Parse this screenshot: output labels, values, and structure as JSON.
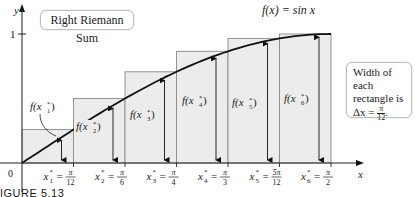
{
  "chart_data": {
    "type": "bar",
    "title": "Right Riemann Sum",
    "function_label": "f(x) = sin x",
    "xlabel": "x",
    "ylabel": "y",
    "x_range": [
      0,
      1.5708
    ],
    "ylim": [
      0,
      1
    ],
    "y_ticks": [
      "0",
      "1"
    ],
    "categories": [
      "x1* = π/12",
      "x2* = π/6",
      "x3* = π/4",
      "x4* = π/3",
      "x5* = 5π/12",
      "x6* = π/2"
    ],
    "sample_points": [
      0.2618,
      0.5236,
      0.7854,
      1.0472,
      1.309,
      1.5708
    ],
    "values": [
      0.259,
      0.5,
      0.707,
      0.866,
      0.966,
      1.0
    ],
    "value_labels": [
      "f(x1*)",
      "f(x2*)",
      "f(x3*)",
      "f(x4*)",
      "f(x5*)",
      "f(x6*)"
    ],
    "rectangle_width": "π/12",
    "annotation": "Width of each rectangle is Δx = π/12.",
    "grid": false,
    "colors": {
      "rect_fill": "#ececec",
      "rect_stroke": "#8a8a8a",
      "curve": "#111111",
      "axis": "#222222"
    }
  },
  "title_box": {
    "text": "Right Riemann Sum"
  },
  "note_box": {
    "line1": "Width of each",
    "line2": "rectangle is",
    "delta": "Δx =",
    "num": "π",
    "den": "12",
    "end": "."
  },
  "axes": {
    "y_label": "y",
    "x_label": "x",
    "origin": "0",
    "y_tick_1": "1"
  },
  "function_label": "f(x) = sin x",
  "figure_caption": "IGURE 5.13",
  "x_ticks": [
    {
      "var": "x",
      "sub": "1",
      "num": "π",
      "den": "12"
    },
    {
      "var": "x",
      "sub": "2",
      "num": "π",
      "den": "6"
    },
    {
      "var": "x",
      "sub": "3",
      "num": "π",
      "den": "4"
    },
    {
      "var": "x",
      "sub": "4",
      "num": "π",
      "den": "3"
    },
    {
      "var": "x",
      "sub": "5",
      "num": "5π",
      "den": "12"
    },
    {
      "var": "x",
      "sub": "6",
      "num": "π",
      "den": "2"
    }
  ],
  "f_labels": [
    "1",
    "2",
    "3",
    "4",
    "5",
    "6"
  ]
}
